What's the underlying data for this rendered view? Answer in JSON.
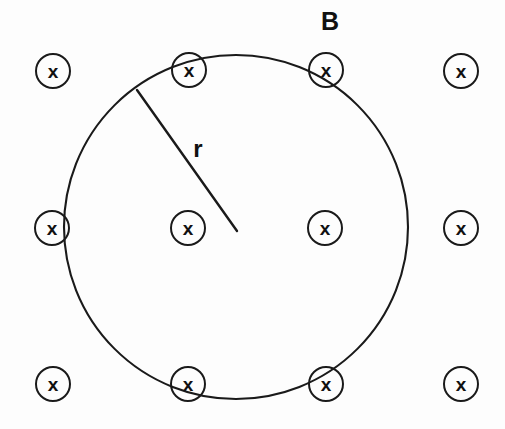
{
  "figure": {
    "background_color": "#fdfdfd",
    "ink_color": "#1a1a1a"
  },
  "labels": {
    "field_label": "B",
    "field_label_x": 330,
    "field_label_y": 30,
    "radius_label": "r",
    "radius_label_x": 198,
    "radius_label_y": 157
  },
  "loop": {
    "name": "circular-loop",
    "center_x": 236,
    "center_y": 227,
    "radius": 172,
    "stroke_width": 2.1
  },
  "radius_indicator": {
    "name": "radius-line",
    "x1": 137,
    "y1": 90,
    "x2": 237,
    "y2": 231
  },
  "field_marker": {
    "glyph": "x",
    "ring_radius": 17,
    "meaning": "magnetic-field-into-page"
  },
  "field_markers": [
    {
      "id": "marker-top-left",
      "cx": 53,
      "cy": 71,
      "glyph": "x"
    },
    {
      "id": "marker-top-inner-left",
      "cx": 189,
      "cy": 70,
      "glyph": "x"
    },
    {
      "id": "marker-top-inner-right",
      "cx": 326,
      "cy": 70,
      "glyph": "x"
    },
    {
      "id": "marker-top-right",
      "cx": 461,
      "cy": 71,
      "glyph": "x"
    },
    {
      "id": "marker-mid-left",
      "cx": 52,
      "cy": 228,
      "glyph": "x"
    },
    {
      "id": "marker-mid-inner-left",
      "cx": 188,
      "cy": 228,
      "glyph": "x"
    },
    {
      "id": "marker-mid-inner-right",
      "cx": 325,
      "cy": 228,
      "glyph": "x"
    },
    {
      "id": "marker-mid-right",
      "cx": 461,
      "cy": 228,
      "glyph": "x"
    },
    {
      "id": "marker-bottom-left",
      "cx": 53,
      "cy": 384,
      "glyph": "x"
    },
    {
      "id": "marker-bottom-inner-left",
      "cx": 188,
      "cy": 384,
      "glyph": "x"
    },
    {
      "id": "marker-bottom-inner-right",
      "cx": 326,
      "cy": 384,
      "glyph": "x"
    },
    {
      "id": "marker-bottom-right",
      "cx": 461,
      "cy": 384,
      "glyph": "x"
    }
  ]
}
